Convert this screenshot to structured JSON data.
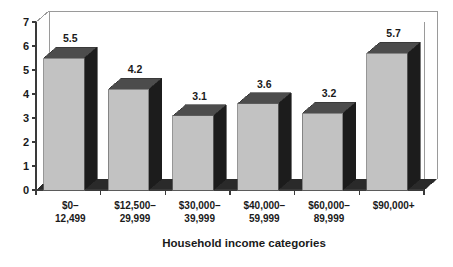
{
  "chart_data": {
    "type": "bar",
    "title": "",
    "subtitle": "",
    "xlabel": "Household income categories",
    "ylabel": "",
    "categories": [
      "$0–\n12,499",
      "$12,500–\n29,999",
      "$30,000–\n39,999",
      "$40,000–\n59,999",
      "$60,000–\n89,999",
      "$90,000+"
    ],
    "category_lines": [
      [
        "$0–",
        "12,499"
      ],
      [
        "$12,500–",
        "29,999"
      ],
      [
        "$30,000–",
        "39,999"
      ],
      [
        "$40,000–",
        "59,999"
      ],
      [
        "$60,000–",
        "89,999"
      ],
      [
        "$90,000+",
        ""
      ]
    ],
    "values": [
      5.5,
      4.2,
      3.1,
      3.6,
      3.2,
      5.7
    ],
    "value_labels": [
      "5.5",
      "4.2",
      "3.1",
      "3.6",
      "3.2",
      "5.7"
    ],
    "ylim": [
      0,
      7
    ],
    "ytick_labels": [
      "0",
      "1",
      "2",
      "3",
      "4",
      "5",
      "6",
      "7"
    ],
    "grid": false,
    "legend": false,
    "style": "3d-columns",
    "colors": {
      "bar_front": "#c2c2c2",
      "bar_side": "#1c1c1c",
      "bar_top": "#4c4c4c",
      "floor": "#2a2a2a",
      "frame_line": "#9a9a9a",
      "axis_line": "#3a3a3a",
      "text": "#1a1a1a",
      "background": "#ffffff"
    }
  },
  "axis": {
    "x_title": "Household income categories"
  }
}
